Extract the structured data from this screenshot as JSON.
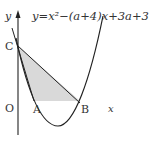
{
  "diagram": {
    "equation": "y=x²−(a+4)x+3a+3",
    "axis_labels": {
      "y": "y",
      "x": "x",
      "origin": "O"
    },
    "points": [
      {
        "name": "C",
        "label": "C"
      },
      {
        "name": "A",
        "label": "A"
      },
      {
        "name": "B",
        "label": "B"
      }
    ],
    "shaded_region": "triangle CAB-like region between chord CB, parabola and horizontal through B",
    "colors": {
      "stroke": "#222222",
      "shade": "#d9d9d9"
    }
  }
}
